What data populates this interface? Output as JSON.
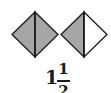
{
  "figure": {
    "colors": {
      "shaded": "#a6a6a6",
      "unshaded": "#ffffff",
      "stroke": "#1a1a1a"
    },
    "shapes": [
      {
        "name": "diamond-1",
        "parts": 2,
        "shaded_parts": 2,
        "left_half": "shaded",
        "right_half": "shaded"
      },
      {
        "name": "diamond-2",
        "parts": 2,
        "shaded_parts": 1,
        "left_half": "shaded",
        "right_half": "unshaded"
      }
    ]
  },
  "label": {
    "whole": "1",
    "numerator": "1",
    "denominator": "2"
  }
}
